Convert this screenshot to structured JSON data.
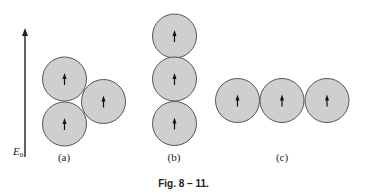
{
  "figure": {
    "caption": "Fig. 8 – 11.",
    "field": {
      "label": "E",
      "subscript": "0",
      "direction": "up",
      "x": 25,
      "y_top": 28,
      "y_bottom": 157
    },
    "circle_style": {
      "fill": "#cfcfcf",
      "stroke": "#555555",
      "radius": 22,
      "arrow_color": "#111111"
    },
    "panels": [
      {
        "label": "(a)",
        "label_pos": [
          64,
          161
        ],
        "arrangement": "triangle",
        "circles": [
          {
            "cx": 64.5,
            "cy": 79,
            "arrow": "up"
          },
          {
            "cx": 64.5,
            "cy": 124,
            "arrow": "up"
          },
          {
            "cx": 103.5,
            "cy": 101.5,
            "arrow": "up"
          }
        ]
      },
      {
        "label": "(b)",
        "label_pos": [
          174,
          161
        ],
        "arrangement": "vertical",
        "circles": [
          {
            "cx": 174.5,
            "cy": 36,
            "arrow": "up"
          },
          {
            "cx": 174.5,
            "cy": 79,
            "arrow": "up"
          },
          {
            "cx": 174.5,
            "cy": 123.5,
            "arrow": "up"
          }
        ]
      },
      {
        "label": "(c)",
        "label_pos": [
          282,
          161
        ],
        "arrangement": "horizontal",
        "circles": [
          {
            "cx": 237.5,
            "cy": 100.5,
            "arrow": "up"
          },
          {
            "cx": 282,
            "cy": 100.5,
            "arrow": "up"
          },
          {
            "cx": 327,
            "cy": 100.5,
            "arrow": "up"
          }
        ]
      }
    ]
  }
}
